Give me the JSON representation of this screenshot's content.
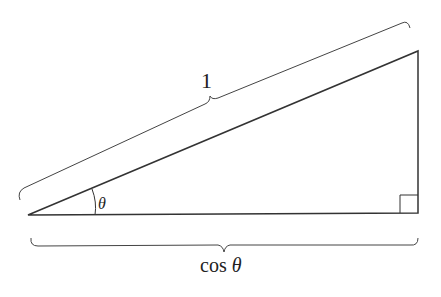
{
  "diagram": {
    "type": "right-triangle",
    "labels": {
      "hypotenuse": "1",
      "angle": "θ",
      "adjacent_prefix": "cos",
      "adjacent_var": "θ"
    },
    "colors": {
      "stroke": "#333333",
      "background": "#ffffff"
    }
  }
}
